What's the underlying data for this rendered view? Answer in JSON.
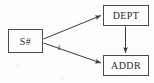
{
  "diagram": {
    "type": "functional-dependency-diagram",
    "background_color": "#fdfdfd",
    "stroke_color": "#4a4a4a",
    "text_color": "#2b2b2b",
    "nodes": [
      {
        "id": "supplier",
        "label": "S#",
        "name": "node-supplier"
      },
      {
        "id": "dept",
        "label": "DEPT",
        "name": "node-dept"
      },
      {
        "id": "addr",
        "label": "ADDR",
        "name": "node-addr"
      }
    ],
    "edges": [
      {
        "id": "s-to-dept",
        "from": "supplier",
        "to": "dept",
        "label": "",
        "name": "edge-supplier-to-dept"
      },
      {
        "id": "s-to-addr",
        "from": "supplier",
        "to": "addr",
        "label": "t",
        "name": "edge-supplier-to-addr"
      },
      {
        "id": "dept-to-addr",
        "from": "dept",
        "to": "addr",
        "label": "",
        "name": "edge-dept-to-addr"
      }
    ],
    "edge_labels": {
      "supplier_to_addr": "t"
    }
  }
}
